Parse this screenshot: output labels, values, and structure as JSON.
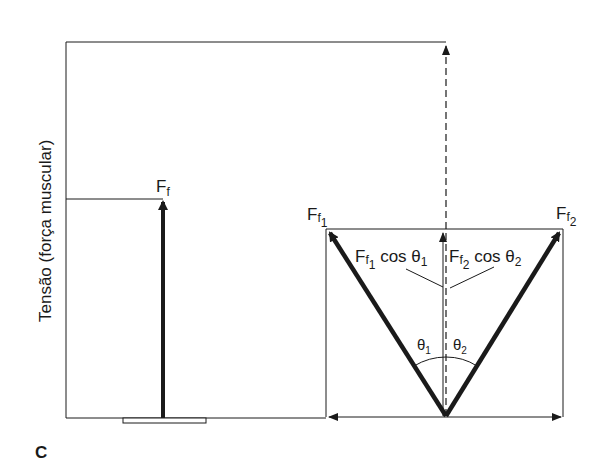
{
  "figure": {
    "panel_label": "C",
    "y_axis_label": "Tensão (força muscular)"
  },
  "labels": {
    "ff": {
      "main": "F",
      "sub": "f"
    },
    "ff1": {
      "main": "F",
      "sub": "f",
      "subsub": "1"
    },
    "ff2": {
      "main": "F",
      "sub": "f",
      "subsub": "2"
    },
    "component1": {
      "main": "F",
      "sub": "f",
      "subsub": "1",
      "rest": " cos θ",
      "theta_sub": "1"
    },
    "component2": {
      "main": "F",
      "sub": "f",
      "subsub": "2",
      "rest": " cos θ",
      "theta_sub": "2"
    },
    "theta1": {
      "symbol": "θ",
      "sub": "1"
    },
    "theta2": {
      "symbol": "θ",
      "sub": "2"
    }
  },
  "colors": {
    "ink": "#1a1a1a",
    "background": "#ffffff"
  }
}
